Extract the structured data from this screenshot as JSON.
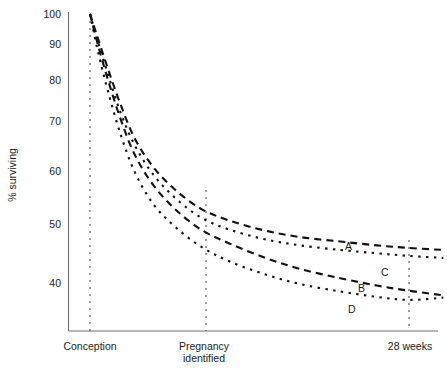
{
  "chart_data": {
    "type": "line",
    "title": "",
    "xlabel": "",
    "ylabel": "% surviving",
    "yscale": "log",
    "ylim": [
      34,
      100
    ],
    "grid": false,
    "legend_position": "inline-right",
    "yticks": [
      100,
      90,
      80,
      70,
      60,
      50,
      40
    ],
    "ytick_labels": [
      "100",
      "90",
      "80",
      "70",
      "60",
      "50",
      "40"
    ],
    "xticks": [
      0,
      0.345,
      0.79
    ],
    "xtick_labels": [
      "Conception",
      "Pregnancy identified",
      "28 weeks"
    ],
    "annotations": [
      {
        "text": "A",
        "x": 0.65,
        "y": 47.5
      },
      {
        "text": "C",
        "x": 0.745,
        "y": 44.0
      },
      {
        "text": "B",
        "x": 0.585,
        "y": 41.8
      },
      {
        "text": "D",
        "x": 0.6,
        "y": 37.3
      }
    ],
    "series": [
      {
        "name": "A",
        "style": "dashed",
        "label": "A",
        "x": [
          0.0,
          0.02,
          0.045,
          0.075,
          0.11,
          0.155,
          0.21,
          0.275,
          0.345,
          0.43,
          0.52,
          0.62,
          0.71,
          0.79,
          0.875
        ],
        "y": [
          100,
          92,
          83,
          74,
          66,
          60,
          55.5,
          52,
          50,
          48.4,
          47.3,
          46.6,
          46.0,
          45.6,
          45.3
        ]
      },
      {
        "name": "C",
        "style": "dotted",
        "label": "C",
        "x": [
          0.0,
          0.02,
          0.045,
          0.075,
          0.11,
          0.155,
          0.21,
          0.275,
          0.345,
          0.43,
          0.52,
          0.62,
          0.71,
          0.79,
          0.875
        ],
        "y": [
          100,
          91,
          81.5,
          72,
          64.5,
          58.5,
          54,
          50.5,
          48.5,
          47.0,
          46.0,
          45.3,
          44.8,
          44.4,
          44.1
        ]
      },
      {
        "name": "B",
        "style": "dashed",
        "label": "B",
        "x": [
          0.0,
          0.02,
          0.045,
          0.075,
          0.11,
          0.155,
          0.21,
          0.275,
          0.345,
          0.43,
          0.52,
          0.62,
          0.71,
          0.79,
          0.875
        ],
        "y": [
          100,
          90,
          80,
          70.5,
          62.5,
          56.5,
          52,
          48.5,
          46.3,
          44.2,
          42.5,
          41.2,
          40.2,
          39.5,
          38.9
        ]
      },
      {
        "name": "D",
        "style": "dotted",
        "label": "D",
        "x": [
          0.0,
          0.02,
          0.045,
          0.075,
          0.11,
          0.155,
          0.21,
          0.275,
          0.345,
          0.43,
          0.52,
          0.62,
          0.71,
          0.79,
          0.875
        ],
        "y": [
          100,
          88,
          77,
          67,
          59,
          53,
          49,
          45.8,
          43.6,
          41.8,
          40.4,
          39.4,
          38.7,
          38.3,
          38.6
        ]
      }
    ],
    "vertical_markers": [
      {
        "name": "conception",
        "x": 0.0,
        "y_top": 100,
        "y_bottom": 34
      },
      {
        "name": "pregnancy-identified",
        "x": 0.345,
        "y_top": 53.0,
        "y_bottom": 34
      },
      {
        "name": "28-weeks",
        "x": 0.79,
        "y_top": 50.0,
        "y_bottom": 34
      }
    ]
  }
}
